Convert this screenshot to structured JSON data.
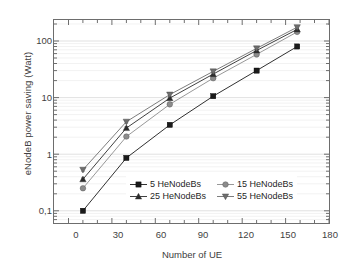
{
  "chart_data": {
    "type": "line",
    "title": "",
    "xlabel": "Number of UE",
    "ylabel": "eNodeB power saving (Watt)",
    "xlim": [
      -10,
      180
    ],
    "ylim": [
      0.05,
      250
    ],
    "yscale": "log",
    "grid": "horizontal-minor-log",
    "legend_position": "lower-center-inside",
    "x": [
      10,
      40,
      70,
      100,
      130,
      158
    ],
    "xticks": [
      "0",
      "30",
      "60",
      "90",
      "120",
      "150",
      "180"
    ],
    "xtick_values": [
      0,
      30,
      60,
      90,
      120,
      150,
      180
    ],
    "yticks": [
      "100",
      "10",
      "1",
      "0,1"
    ],
    "ytick_values": [
      100,
      10,
      1,
      0.1
    ],
    "series": [
      {
        "name": "5 HeNodeBs",
        "marker": "square",
        "color": "#1a1a1a",
        "values": [
          0.1,
          0.86,
          3.3,
          10.6,
          30,
          80
        ],
        "errors": [
          0.005,
          0.04,
          0.18,
          0.5,
          1.6,
          4.5
        ]
      },
      {
        "name": "15 HeNodeBs",
        "marker": "circle",
        "color": "#8c8c8c",
        "values": [
          0.25,
          2.05,
          7.6,
          22,
          58,
          145
        ],
        "errors": [
          0.012,
          0.1,
          0.4,
          1.2,
          3.2,
          8
        ]
      },
      {
        "name": "25 HeNodeBs",
        "marker": "triangle-up",
        "color": "#2b2b2b",
        "values": [
          0.36,
          2.9,
          9.8,
          26,
          68,
          160
        ],
        "errors": [
          0.02,
          0.15,
          0.55,
          1.5,
          4,
          9
        ]
      },
      {
        "name": "55 HeNodeBs",
        "marker": "triangle-down",
        "color": "#6e6e6e",
        "values": [
          0.53,
          3.75,
          11.3,
          29,
          74,
          175
        ],
        "errors": [
          0.03,
          0.2,
          0.7,
          1.8,
          4.5,
          10
        ]
      }
    ]
  },
  "axes": {
    "x_title": "Number of UE",
    "y_title": "eNodeB power saving (Watt)",
    "xticks": [
      "0",
      "30",
      "60",
      "90",
      "120",
      "150",
      "180"
    ],
    "yticks": [
      "100",
      "10",
      "1",
      "0,1"
    ]
  },
  "legend": {
    "items": [
      {
        "label": "5 HeNodeBs",
        "marker": "square",
        "color": "#1a1a1a"
      },
      {
        "label": "15 HeNodeBs",
        "marker": "circle",
        "color": "#8c8c8c"
      },
      {
        "label": "25 HeNodeBs",
        "marker": "triangle-up",
        "color": "#2b2b2b"
      },
      {
        "label": "55 HeNodeBs",
        "marker": "triangle-down",
        "color": "#6e6e6e"
      }
    ]
  },
  "colors": {
    "frame": "#6d6d6d",
    "grid": "#e8e8e8",
    "text": "#3f3f3f",
    "background": "#ffffff"
  }
}
